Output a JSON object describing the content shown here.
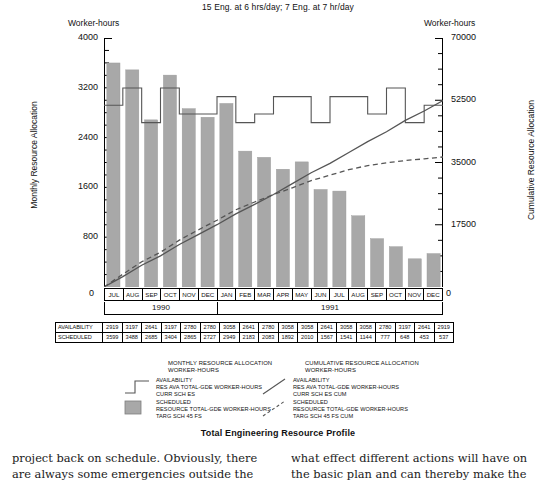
{
  "header": {
    "subtitle": "15 Eng. at 6 hrs/day; 7 Eng. at 7 hr/day",
    "worker_hours_left": "Worker-hours",
    "worker_hours_right": "Worker-hours"
  },
  "axes": {
    "left_title": "Monthly Resource Allocation",
    "right_title": "Cumulative Resource Allocation",
    "left_ticks": [
      "4000",
      "3200",
      "2400",
      "1600",
      "800",
      "0"
    ],
    "right_ticks": [
      "70000",
      "52500",
      "35000",
      "17500",
      "0"
    ],
    "left_min": 0,
    "left_max": 4000,
    "right_min": 0,
    "right_max": 70000
  },
  "chart_data": {
    "type": "bar",
    "title": "Total Engineering Resource Profile",
    "xlabel": "",
    "ylabel": "Monthly Resource Allocation",
    "ylim": [
      0,
      4000
    ],
    "y2lim": [
      0,
      70000
    ],
    "y2label": "Cumulative Resource Allocation",
    "grid": false,
    "legend": "below",
    "categories": [
      "JUL",
      "AUG",
      "SEP",
      "OCT",
      "NOV",
      "DEC",
      "JAN",
      "FEB",
      "MAR",
      "APR",
      "MAY",
      "JUN",
      "JUL",
      "AUG",
      "SEP",
      "OCT",
      "NOV",
      "DEC"
    ],
    "years": [
      {
        "label": "1990",
        "span": 6
      },
      {
        "label": "1991",
        "span": 12
      }
    ],
    "series": [
      {
        "name": "SCHEDULED RESOURCE TOTAL-GDE WORKER-HOURS TARG SCH 45 FS",
        "render": "bar",
        "axis": "left",
        "color": "#a8a8a8",
        "values": [
          3599,
          3488,
          2685,
          3404,
          2865,
          2727,
          2949,
          2183,
          2083,
          1892,
          2010,
          1567,
          1541,
          1144,
          777,
          648,
          453,
          537
        ]
      },
      {
        "name": "AVAILABILITY RES AVA TOTAL-GDE WORKER-HOURS CURR SCH ES",
        "render": "step",
        "axis": "left",
        "color": "#555555",
        "values": [
          2919,
          3197,
          2641,
          3197,
          2780,
          2780,
          3058,
          2641,
          2780,
          3058,
          3058,
          2641,
          3058,
          3058,
          2780,
          3197,
          2641,
          2919
        ]
      },
      {
        "name": "AVAILABILITY RES AVA TOTAL-GDE WORKER-HOURS CURR SCH ES CUM",
        "render": "line",
        "axis": "right",
        "color": "#555555",
        "values": [
          2919,
          6116,
          8757,
          11954,
          14734,
          17514,
          20572,
          23213,
          25993,
          29051,
          32109,
          34750,
          37808,
          40866,
          43646,
          46843,
          49484,
          52403
        ]
      },
      {
        "name": "SCHEDULED RESOURCE TOTAL-GDE WORKER-HOURS TARG SCH 45 FS CUM",
        "render": "dashed-line",
        "axis": "right",
        "color": "#555555",
        "values": [
          3599,
          7087,
          9772,
          13176,
          16041,
          18768,
          21717,
          23900,
          25983,
          27875,
          29885,
          31452,
          32993,
          34137,
          34914,
          35562,
          36015,
          36552
        ]
      }
    ]
  },
  "table": {
    "rows": [
      {
        "header": "AVAILABILITY",
        "values": [
          "2919",
          "3197",
          "2641",
          "3197",
          "2780",
          "2780",
          "3058",
          "2641",
          "2780",
          "3058",
          "3058",
          "2641",
          "3058",
          "3058",
          "2780",
          "3197",
          "2641",
          "2919"
        ]
      },
      {
        "header": "SCHEDULED",
        "values": [
          "3599",
          "3488",
          "2685",
          "3404",
          "2865",
          "2727",
          "2949",
          "2183",
          "2083",
          "1892",
          "2010",
          "1567",
          "1541",
          "1144",
          "777",
          "648",
          "453",
          "537"
        ]
      }
    ]
  },
  "legend": {
    "left": {
      "title_line1": "MONTHLY RESOURCE ALLOCATION",
      "title_line2": "WORKER-HOURS",
      "entries": [
        {
          "symbol": "step-line",
          "lines": [
            "AVAILABILITY",
            "RES AVA TOTAL-GDE WORKER-HOURS",
            "CURR SCH ES"
          ]
        },
        {
          "symbol": "gray-swatch",
          "lines": [
            "SCHEDULED",
            "RESOURCE TOTAL-GDE WORKER-HOURS",
            "TARG SCH 45 FS"
          ]
        }
      ]
    },
    "right": {
      "title_line1": "CUMULATIVE RESOURCE ALLOCATION",
      "title_line2": "WORKER-HOURS",
      "entries": [
        {
          "symbol": "solid-line",
          "lines": [
            "AVAILABILITY",
            "RES AVA TOTAL-GDE WORKER-HOURS",
            "CURR SCH ES CUM"
          ]
        },
        {
          "symbol": "dashed-line",
          "lines": [
            "SCHEDULED",
            "RESOURCE TOTAL-GDE WORKER-HOURS",
            "TARG SCH 45 FS CUM"
          ]
        }
      ]
    }
  },
  "figure_title": "Total Engineering Resource Profile",
  "body_text": {
    "left_col": "project back on schedule. Obviously, there are always some emergencies outside the plan",
    "right_col": "what effect different actions will have on the basic plan and can thereby make the best use"
  },
  "colors": {
    "bar": "#a8a8a8",
    "line": "#555555",
    "axis": "#000000"
  }
}
